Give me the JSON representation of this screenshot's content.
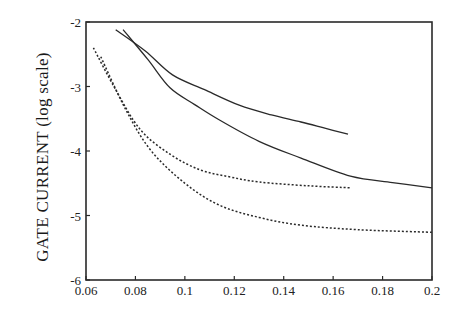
{
  "chart_data": {
    "type": "line",
    "title": "",
    "xlabel": "",
    "ylabel": "GATE CURRENT (log scale)",
    "xlim": [
      0.06,
      0.2
    ],
    "ylim": [
      -6,
      -2
    ],
    "grid": false,
    "legend": null,
    "x_ticks": [
      "0.06",
      "0.08",
      "0.1",
      "0.12",
      "0.14",
      "0.16",
      "0.18",
      "0.2"
    ],
    "y_ticks": [
      "-2",
      "-3",
      "-4",
      "-5",
      "-6"
    ],
    "series": [
      {
        "name": "solid-upper",
        "style": "solid",
        "points": [
          [
            0.072,
            -2.12
          ],
          [
            0.084,
            -2.45
          ],
          [
            0.095,
            -2.82
          ],
          [
            0.108,
            -3.05
          ],
          [
            0.122,
            -3.29
          ],
          [
            0.135,
            -3.44
          ],
          [
            0.147,
            -3.55
          ],
          [
            0.157,
            -3.65
          ],
          [
            0.166,
            -3.74
          ]
        ]
      },
      {
        "name": "solid-lower",
        "style": "solid",
        "points": [
          [
            0.075,
            -2.12
          ],
          [
            0.085,
            -2.58
          ],
          [
            0.094,
            -3.02
          ],
          [
            0.104,
            -3.28
          ],
          [
            0.114,
            -3.52
          ],
          [
            0.13,
            -3.85
          ],
          [
            0.147,
            -4.11
          ],
          [
            0.167,
            -4.39
          ],
          [
            0.184,
            -4.49
          ],
          [
            0.2,
            -4.57
          ]
        ]
      },
      {
        "name": "dashed-upper",
        "style": "dashed",
        "points": [
          [
            0.063,
            -2.4
          ],
          [
            0.072,
            -3.05
          ],
          [
            0.082,
            -3.67
          ],
          [
            0.094,
            -4.05
          ],
          [
            0.106,
            -4.29
          ],
          [
            0.118,
            -4.4
          ],
          [
            0.13,
            -4.48
          ],
          [
            0.15,
            -4.54
          ],
          [
            0.167,
            -4.57
          ]
        ]
      },
      {
        "name": "dashed-lower",
        "style": "dashed",
        "points": [
          [
            0.066,
            -2.54
          ],
          [
            0.076,
            -3.35
          ],
          [
            0.086,
            -3.98
          ],
          [
            0.1,
            -4.5
          ],
          [
            0.114,
            -4.84
          ],
          [
            0.13,
            -5.03
          ],
          [
            0.147,
            -5.15
          ],
          [
            0.17,
            -5.22
          ],
          [
            0.2,
            -5.26
          ]
        ]
      }
    ]
  }
}
